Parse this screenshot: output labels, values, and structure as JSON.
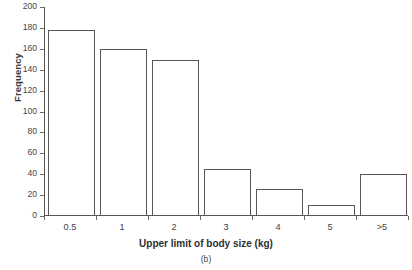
{
  "chart_data": {
    "type": "bar",
    "title": "",
    "subtitle": "",
    "caption": "(b)",
    "xlabel": "Upper limit of body size (kg)",
    "ylabel": "Frequency",
    "categories": [
      "0.5",
      "1",
      "2",
      "3",
      "4",
      "5",
      ">5"
    ],
    "values": [
      178,
      160,
      149,
      45,
      26,
      11,
      40
    ],
    "series": [
      {
        "name": "Frequency",
        "values": [
          178,
          160,
          149,
          45,
          26,
          11,
          40
        ]
      }
    ],
    "ylim": [
      0,
      200
    ],
    "yticks": [
      0,
      20,
      40,
      60,
      80,
      100,
      120,
      140,
      160,
      180,
      200
    ],
    "ytick_labels": [
      "0",
      "20",
      "40",
      "60",
      "80",
      "100",
      "120",
      "140",
      "160",
      "180",
      "200"
    ],
    "grid": false,
    "legend": false,
    "legend_position": "none",
    "bar_fill_color": "#ffffff",
    "bar_edge_color": "#55555a",
    "axis_color": "#55555a",
    "background_color": "#ffffff"
  }
}
